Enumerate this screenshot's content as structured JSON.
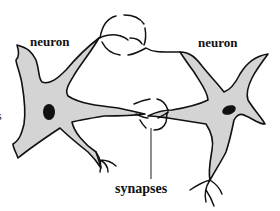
{
  "diagram": {
    "type": "biology-schematic",
    "labels": {
      "left_neuron": "neuron",
      "right_neuron": "neuron",
      "synapses": "synapses",
      "left_edge_fragment": "s"
    },
    "colors": {
      "cell_fill": "#d4d4d4",
      "outline": "#111111",
      "nucleus": "#111111",
      "background": "#ffffff"
    },
    "nodes": [
      {
        "id": "left-neuron",
        "label": "neuron",
        "has_nucleus": true
      },
      {
        "id": "right-neuron",
        "label": "neuron",
        "has_nucleus": true
      },
      {
        "id": "synapse-top",
        "kind": "synapse"
      },
      {
        "id": "synapse-bottom",
        "kind": "synapse"
      }
    ],
    "edges": [
      {
        "from": "left-neuron",
        "to": "synapse-top",
        "kind": "axon"
      },
      {
        "from": "synapse-top",
        "to": "right-neuron",
        "kind": "dendrite"
      },
      {
        "from": "left-neuron",
        "to": "synapse-bottom",
        "kind": "axon"
      },
      {
        "from": "synapse-bottom",
        "to": "right-neuron",
        "kind": "dendrite"
      }
    ],
    "callouts": [
      {
        "label": "synapses",
        "points_to": "synapse-bottom"
      }
    ]
  }
}
